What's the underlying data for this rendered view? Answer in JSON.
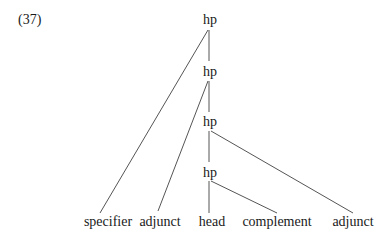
{
  "example_number": "(37)",
  "nodes": {
    "hp1": {
      "label": "hp",
      "x": 210,
      "y": 12
    },
    "hp2": {
      "label": "hp",
      "x": 210,
      "y": 64
    },
    "hp3": {
      "label": "hp",
      "x": 210,
      "y": 114
    },
    "hp4": {
      "label": "hp",
      "x": 210,
      "y": 165
    }
  },
  "leaves": {
    "specifier": {
      "label": "specifier",
      "x": 108,
      "y": 214
    },
    "adjunct_left": {
      "label": "adjunct",
      "x": 160,
      "y": 214
    },
    "head": {
      "label": "head",
      "x": 212,
      "y": 214
    },
    "complement": {
      "label": "complement",
      "x": 277,
      "y": 214
    },
    "adjunct_right": {
      "label": "adjunct",
      "x": 353,
      "y": 214
    }
  },
  "edges": [
    {
      "from": "hp1",
      "to": "hp2"
    },
    {
      "from": "hp1",
      "to": "specifier"
    },
    {
      "from": "hp2",
      "to": "hp3"
    },
    {
      "from": "hp2",
      "to": "adjunct_left"
    },
    {
      "from": "hp3",
      "to": "hp4"
    },
    {
      "from": "hp3",
      "to": "adjunct_right"
    },
    {
      "from": "hp4",
      "to": "head"
    },
    {
      "from": "hp4",
      "to": "complement"
    }
  ]
}
